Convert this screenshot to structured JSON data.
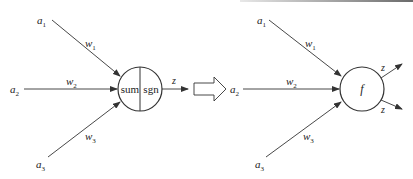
{
  "diagram": {
    "type": "neuron-model-equivalence",
    "left_model": {
      "inputs": [
        {
          "label": "a",
          "sub": "1"
        },
        {
          "label": "a",
          "sub": "2"
        },
        {
          "label": "a",
          "sub": "3"
        }
      ],
      "weights": [
        {
          "label": "w",
          "sub": "1"
        },
        {
          "label": "w",
          "sub": "2"
        },
        {
          "label": "w",
          "sub": "3"
        }
      ],
      "node": {
        "left_label": "sum",
        "right_label": "sgn"
      },
      "output": {
        "label": "z"
      }
    },
    "transform_arrow": {
      "direction": "right"
    },
    "right_model": {
      "inputs": [
        {
          "label": "a",
          "sub": "1"
        },
        {
          "label": "a",
          "sub": "2"
        },
        {
          "label": "a",
          "sub": "3"
        }
      ],
      "weights": [
        {
          "label": "w",
          "sub": "1"
        },
        {
          "label": "w",
          "sub": "2"
        },
        {
          "label": "w",
          "sub": "3"
        }
      ],
      "node": {
        "label": "f"
      },
      "outputs": [
        {
          "label": "z"
        },
        {
          "label": "z"
        }
      ]
    },
    "colors": {
      "line": "#333333",
      "background": "#ffffff"
    }
  }
}
